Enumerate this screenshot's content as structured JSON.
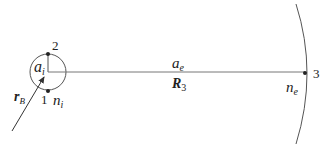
{
  "diagram": {
    "colors": {
      "stroke": "#555555",
      "text": "#222222",
      "background": "#ffffff"
    },
    "inner_circle": {
      "label_main": "a",
      "label_sub": "i",
      "medium_label_main": "n",
      "medium_label_sub": "i"
    },
    "points": [
      {
        "id": "1",
        "label": "1"
      },
      {
        "id": "2",
        "label": "2"
      },
      {
        "id": "3",
        "label": "3"
      }
    ],
    "connector": {
      "top_label_main": "a",
      "top_label_sub": "e",
      "bottom_label_main": "R",
      "bottom_label_sub": "3"
    },
    "outer_arc": {
      "medium_label_main": "n",
      "medium_label_sub": "e"
    },
    "vector": {
      "label_main": "r",
      "label_sub": "B"
    }
  }
}
